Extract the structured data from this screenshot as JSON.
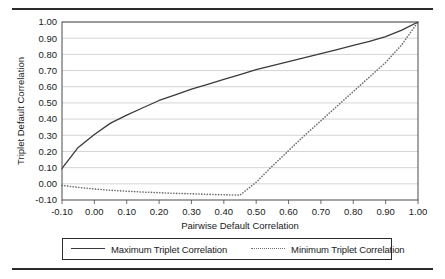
{
  "chart_data": {
    "type": "line",
    "title": "",
    "xlabel": "Pairwise Default Correlation",
    "ylabel": "Triplet Default Correlation",
    "xlim": [
      -0.1,
      1.0
    ],
    "ylim": [
      -0.1,
      1.0
    ],
    "grid": "horizontal",
    "legend_position": "bottom",
    "xticks": [
      "-0.10",
      "0.00",
      "0.10",
      "0.20",
      "0.30",
      "0.40",
      "0.50",
      "0.60",
      "0.70",
      "0.80",
      "0.90",
      "1.00"
    ],
    "yticks": [
      "-0.10",
      "0.00",
      "0.10",
      "0.20",
      "0.30",
      "0.40",
      "0.50",
      "0.60",
      "0.70",
      "0.80",
      "0.90",
      "1.00"
    ],
    "x": [
      -0.1,
      -0.05,
      0.0,
      0.05,
      0.1,
      0.15,
      0.2,
      0.25,
      0.3,
      0.35,
      0.4,
      0.45,
      0.5,
      0.55,
      0.6,
      0.65,
      0.7,
      0.75,
      0.8,
      0.85,
      0.9,
      0.95,
      1.0
    ],
    "series": [
      {
        "name": "Maximum Triplet Correlation",
        "style": "solid",
        "color": "#3a3a3a",
        "values": [
          0.095,
          0.225,
          0.305,
          0.375,
          0.425,
          0.47,
          0.515,
          0.55,
          0.585,
          0.615,
          0.645,
          0.675,
          0.705,
          0.73,
          0.755,
          0.78,
          0.805,
          0.83,
          0.855,
          0.88,
          0.91,
          0.95,
          1.0
        ]
      },
      {
        "name": "Minimum Triplet Correlation",
        "style": "dotted",
        "color": "#6e6e6e",
        "values": [
          -0.01,
          -0.022,
          -0.032,
          -0.04,
          -0.046,
          -0.051,
          -0.055,
          -0.059,
          -0.062,
          -0.065,
          -0.068,
          -0.07,
          0.01,
          0.11,
          0.205,
          0.3,
          0.39,
          0.48,
          0.57,
          0.66,
          0.75,
          0.86,
          1.0
        ]
      }
    ]
  },
  "legend": {
    "entries": [
      {
        "label": "Maximum Triplet Correlation",
        "style": "solid"
      },
      {
        "label": "Minimum Triplet Correlation",
        "style": "dotted"
      }
    ]
  }
}
